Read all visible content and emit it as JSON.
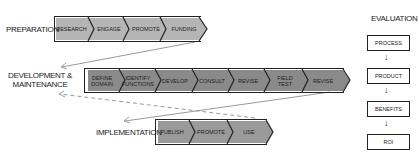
{
  "phases": [
    {
      "label": "Preparation",
      "steps": [
        "Research",
        "Engage",
        "Promote",
        "Funding"
      ]
    },
    {
      "label": "Development & Maintenance",
      "label_line1": "Development &",
      "label_line2": "Maintenance",
      "steps": [
        "Define Domain",
        "Identify Functions",
        "Develop",
        "Consult",
        "Revise",
        "Field Test",
        "Revise"
      ]
    },
    {
      "label": "Implementation",
      "steps": [
        "Publish",
        "Promote",
        "Use"
      ]
    }
  ],
  "evaluation": {
    "title": "Evaluation",
    "steps": [
      "Process",
      "Product",
      "Benefits",
      "ROI"
    ],
    "arrow": "↓"
  },
  "colors": {
    "fill_light": "#b5b5b5",
    "fill_dark": "#8a8a8a",
    "outline": "#222222",
    "connector": "#aaaaaa"
  }
}
